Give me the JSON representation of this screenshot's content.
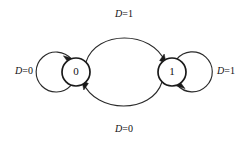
{
  "diagram": {
    "background_color": "#ffffff",
    "line_color": "#2a2a2a",
    "node_stroke_color": "#1a1a1a",
    "text_color": "#111111",
    "states": [
      {
        "id": "state-0",
        "label": "0",
        "cx": 76,
        "cy": 72,
        "r": 14
      },
      {
        "id": "state-1",
        "label": "1",
        "cx": 172,
        "cy": 72,
        "r": 14
      }
    ],
    "transitions": [
      {
        "id": "loop-0-self",
        "from": "0",
        "to": "0",
        "label_var": "D",
        "label_eq": "=0",
        "label_full": "D=0",
        "label_x": 24,
        "label_y": 72,
        "kind": "self-loop",
        "side": "left"
      },
      {
        "id": "edge-0-to-1",
        "from": "0",
        "to": "1",
        "label_var": "D",
        "label_eq": "=1",
        "label_full": "D=1",
        "label_x": 124,
        "label_y": 15,
        "kind": "arc",
        "side": "top"
      },
      {
        "id": "edge-1-to-0",
        "from": "1",
        "to": "0",
        "label_var": "D",
        "label_eq": "=0",
        "label_full": "D=0",
        "label_x": 124,
        "label_y": 130,
        "kind": "arc",
        "side": "bottom"
      },
      {
        "id": "loop-1-self",
        "from": "1",
        "to": "1",
        "label_var": "D",
        "label_eq": "=1",
        "label_full": "D=1",
        "label_x": 226,
        "label_y": 72,
        "kind": "self-loop",
        "side": "right"
      }
    ]
  }
}
